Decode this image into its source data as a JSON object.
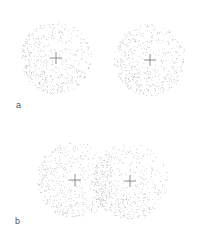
{
  "figure": {
    "background": "#ffffff",
    "dot_color": "#a8a8a8",
    "cross_color": "#777777",
    "panels": [
      {
        "label": "a",
        "label_pos": {
          "x": 16,
          "y": 101
        },
        "description": "two separated stippled spheres",
        "spheres": [
          {
            "cx": 56,
            "cy": 58,
            "r": 36
          },
          {
            "cx": 150,
            "cy": 60,
            "r": 36
          }
        ]
      },
      {
        "label": "b",
        "label_pos": {
          "x": 15,
          "y": 217
        },
        "description": "two overlapping stippled spheres",
        "spheres": [
          {
            "cx": 75,
            "cy": 180,
            "r": 38
          },
          {
            "cx": 130,
            "cy": 181,
            "r": 38
          }
        ]
      }
    ]
  }
}
